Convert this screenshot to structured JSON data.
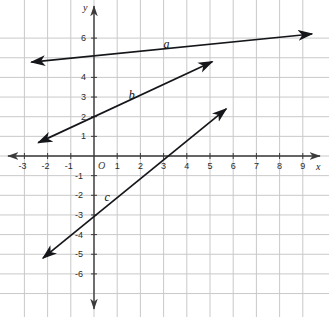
{
  "chart_data": {
    "type": "line",
    "title": "",
    "xlabel": "x",
    "ylabel": "y",
    "xlim": [
      -3.8,
      9.9
    ],
    "ylim": [
      -7.0,
      6.9
    ],
    "grid": true,
    "grid_step": 1,
    "legend": "inline-labels",
    "origin_label": "O",
    "x_ticks": [
      -3,
      -2,
      -1,
      1,
      2,
      3,
      4,
      5,
      6,
      7,
      8,
      9
    ],
    "x_tick_labels": [
      "-3",
      "-2",
      "-1",
      "1",
      "2",
      "3",
      "4",
      "5",
      "6",
      "7",
      "8",
      "9"
    ],
    "y_ticks": [
      6,
      4,
      3,
      2,
      1,
      -1,
      -2,
      -3,
      -4,
      -5,
      -6
    ],
    "y_tick_labels": [
      "6",
      "4",
      "3",
      "2",
      "1",
      "-1",
      "-2",
      "-3",
      "-4",
      "-5",
      "-6"
    ],
    "series": [
      {
        "name": "a",
        "label": "a",
        "slope": 0.12,
        "intercept": 5.6,
        "x_start": -2.7,
        "x_end": 9.4,
        "y_start": 4.78,
        "y_end": 6.21,
        "label_x": 3.0,
        "label_y": 6.0,
        "arrows": "both"
      },
      {
        "name": "b",
        "label": "b",
        "slope": 0.55,
        "intercept": 2.0,
        "x_start": -2.4,
        "x_end": 5.1,
        "y_start": 0.68,
        "y_end": 4.8,
        "label_x": 1.5,
        "label_y": 3.4,
        "arrows": "both"
      },
      {
        "name": "c",
        "label": "c",
        "slope": 1.0,
        "intercept": -3.0,
        "x_start": -2.2,
        "x_end": 5.7,
        "y_start": -5.2,
        "y_end": 2.4,
        "label_x": 0.45,
        "label_y": -1.8,
        "arrows": "both"
      }
    ],
    "colors": {
      "grid": "#c9c9c9",
      "axis": "#3b3b3b",
      "line": "#15161a",
      "background": "#ffffff"
    }
  }
}
